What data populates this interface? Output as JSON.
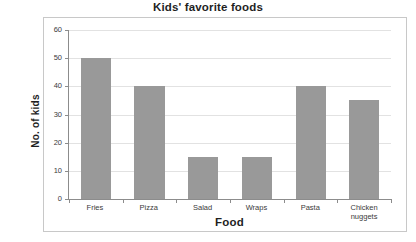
{
  "chart_data": {
    "type": "bar",
    "title": "Kids' favorite foods",
    "xlabel": "Food",
    "ylabel": "No. of kids",
    "categories": [
      "Fries",
      "Pizza",
      "Salad",
      "Wraps",
      "Pasta",
      "Chicken nuggets"
    ],
    "values": [
      50,
      40,
      15,
      15,
      40,
      35
    ],
    "ylim": [
      0,
      60
    ],
    "yticks": [
      0,
      10,
      20,
      30,
      40,
      50,
      60
    ],
    "ytick_labels": [
      "0",
      "10",
      "20",
      "30",
      "40",
      "50",
      "60"
    ],
    "grid": "horizontal",
    "legend": null,
    "bar_color": "#999999",
    "gridline_color": "#e2e2e2",
    "axis_color": "#8c8c8c",
    "frame_color": "#c8c8c8",
    "background": "#ffffff",
    "text_color": "#3a3a3a"
  }
}
